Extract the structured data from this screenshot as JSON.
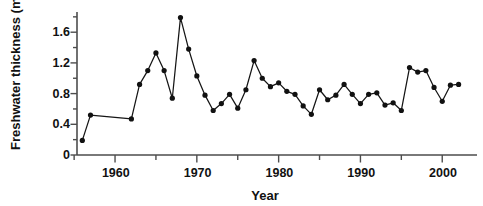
{
  "chart_data": {
    "type": "line",
    "title": "",
    "xlabel": "Year",
    "ylabel": "Freshwater thickness (m)",
    "xlim": [
      1955,
      2003
    ],
    "ylim": [
      0,
      1.85
    ],
    "grid": false,
    "legend": null,
    "marker": "filled-circle",
    "x_ticks_major": [
      1960,
      1970,
      1980,
      1990,
      2000
    ],
    "x_ticks_minor": [
      1955,
      1965,
      1975,
      1985,
      1995
    ],
    "x_tick_labels": [
      "1960",
      "1970",
      "1980",
      "1990",
      "2000"
    ],
    "y_ticks_major": [
      0,
      0.4,
      0.8,
      1.2,
      1.6
    ],
    "y_ticks_minor": [
      0.2,
      0.6,
      1.0,
      1.4,
      1.8
    ],
    "y_tick_labels": [
      "0",
      "0.4",
      "0.8",
      "1.2",
      "1.6"
    ],
    "series": [
      {
        "name": "Freshwater thickness",
        "color": "#111111",
        "x": [
          1956,
          1957,
          1962,
          1963,
          1964,
          1965,
          1966,
          1967,
          1968,
          1969,
          1970,
          1971,
          1972,
          1973,
          1974,
          1975,
          1976,
          1977,
          1978,
          1979,
          1980,
          1981,
          1982,
          1983,
          1984,
          1985,
          1986,
          1987,
          1988,
          1989,
          1990,
          1991,
          1992,
          1993,
          1994,
          1995,
          1996,
          1997,
          1998,
          1999,
          2000,
          2001,
          2002
        ],
        "y": [
          0.19,
          0.52,
          0.47,
          0.92,
          1.1,
          1.33,
          1.1,
          0.74,
          1.79,
          1.38,
          1.03,
          0.78,
          0.58,
          0.67,
          0.79,
          0.61,
          0.85,
          1.23,
          1.0,
          0.89,
          0.94,
          0.83,
          0.79,
          0.64,
          0.53,
          0.85,
          0.72,
          0.78,
          0.92,
          0.79,
          0.67,
          0.79,
          0.81,
          0.65,
          0.68,
          0.58,
          1.14,
          1.08,
          1.1,
          0.88,
          0.7,
          0.91,
          0.92
        ]
      }
    ]
  },
  "axes": {
    "y_axis_name": "y-axis",
    "x_axis_name": "x-axis"
  }
}
